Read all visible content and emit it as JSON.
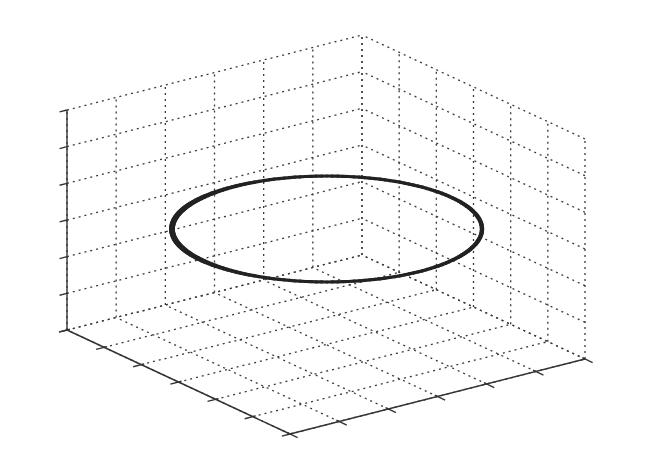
{
  "chart_data": {
    "type": "line3d",
    "title": "",
    "xlabel": "",
    "ylabel": "",
    "zlabel": "",
    "tick_labels_visible": false,
    "grid": true,
    "box": "back walls + floor with dotted grid",
    "divisions": {
      "x": 6,
      "y": 6,
      "z": 6
    },
    "series": [
      {
        "name": "circle",
        "description": "Closed circular trajectory at constant height (mid-level of z-range)",
        "shape": "circle",
        "z_level_fraction": 0.45,
        "color": "#222222",
        "line_width": 4
      }
    ],
    "legend": null
  },
  "projection": {
    "front_corner": [
      290,
      434
    ],
    "left_corner": [
      67,
      330
    ],
    "right_corner": [
      585,
      359
    ],
    "height_px": 220
  },
  "curve_screen": {
    "cx": 327,
    "cy": 229,
    "rx": 155,
    "ry": 53
  },
  "colors": {
    "grid": "#3a3a3a",
    "axis": "#333333",
    "curve": "#222222",
    "background": "#ffffff"
  }
}
